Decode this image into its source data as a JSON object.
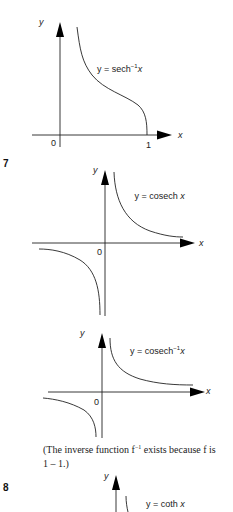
{
  "graphs": [
    {
      "id": "sech-inverse",
      "axis_x": "x",
      "axis_y": "y",
      "origin": "0",
      "tick_x": "1",
      "label_prefix": "y = sech",
      "label_sup": "−1",
      "label_var": "x"
    },
    {
      "id": "cosech",
      "number": "7",
      "axis_x": "x",
      "axis_y": "y",
      "origin": "0",
      "label_prefix": "y = cosech",
      "label_var": "x"
    },
    {
      "id": "cosech-inverse",
      "axis_x": "x",
      "axis_y": "y",
      "origin": "0",
      "label_prefix": "y = cosech",
      "label_sup": "−1",
      "label_var": "x"
    },
    {
      "id": "coth",
      "number": "8",
      "axis_y": "y",
      "label_prefix": "y = coth",
      "label_var": "x"
    }
  ],
  "caption": {
    "line1_a": "(The inverse function f",
    "line1_sup": "−1",
    "line1_b": " exists because f is",
    "line2": "1 – 1.)"
  }
}
